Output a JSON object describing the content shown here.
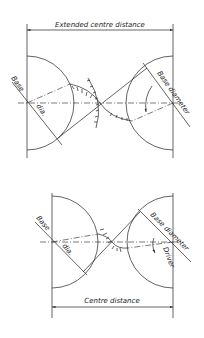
{
  "figures": [
    {
      "name": "extended-centre-distance",
      "dimension_label": "Extended centre distance",
      "left_label_1": "Base",
      "left_label_2": "dia.",
      "right_label": "Base diameter"
    },
    {
      "name": "centre-distance",
      "dimension_label": "Centre distance",
      "left_label_1": "Base",
      "left_label_2": "dia.",
      "right_label": "Base diameter",
      "driver_label": "Driver"
    }
  ]
}
